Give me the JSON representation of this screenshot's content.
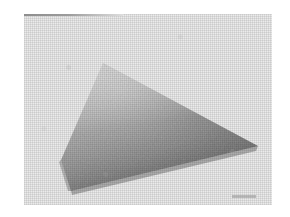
{
  "figure": {
    "kind": "scanned-photograph",
    "caption": "",
    "canvas": {
      "width": 290,
      "height": 217
    },
    "background_color": "#ffffff"
  },
  "photo": {
    "name": "photographic-print",
    "x": 24,
    "y": 14,
    "width": 248,
    "height": 191,
    "paper_color": "#ebebeb",
    "texture": "halftone-dither",
    "top_edge_line_color": "#8e8e8e",
    "smudge_color": "#969696"
  },
  "subject": {
    "name": "flat-plate-in-perspective",
    "description": "Flat square plate photographed obliquely, appearing as a quadrilateral with a tonal gradient running light at the far top-left to dark at the near bottom-right.",
    "shape": "quadrilateral",
    "vertices": [
      {
        "label": "top",
        "x": 103,
        "y": 63
      },
      {
        "label": "right",
        "x": 258,
        "y": 146
      },
      {
        "label": "bottom",
        "x": 71,
        "y": 191
      },
      {
        "label": "left",
        "x": 61,
        "y": 160
      }
    ],
    "gradient": {
      "direction": "top-left-light-to-bottom-right-dark",
      "light_color": "#c0c0c0",
      "mid_color": "#9a9a9a",
      "dark_color": "#6d6d6d",
      "darkest_color": "#5a5a5a"
    },
    "edge_color": "#5f5f5f"
  }
}
